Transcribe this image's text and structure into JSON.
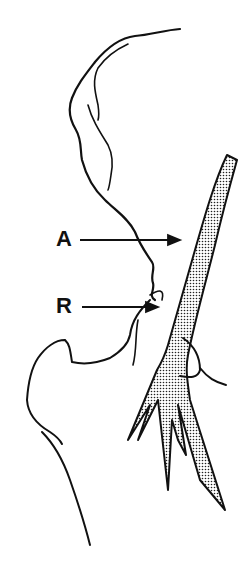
{
  "figure": {
    "type": "anatomical line illustration",
    "background": "#ffffff",
    "ink_color": "#111111",
    "vessel_fill": "stippled",
    "labels": [
      {
        "id": "A",
        "text": "A",
        "x": 56,
        "y": 228,
        "arrow_to": [
          180,
          240
        ]
      },
      {
        "id": "R",
        "text": "R",
        "x": 56,
        "y": 295,
        "arrow_to": [
          157,
          307
        ]
      }
    ]
  }
}
